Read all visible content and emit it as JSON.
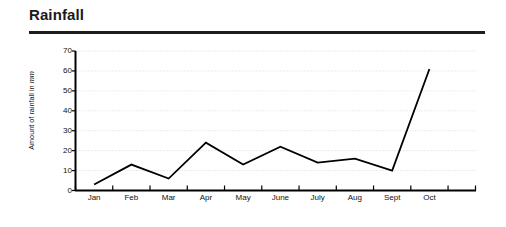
{
  "header": {
    "title": "Rainfall"
  },
  "chart_data": {
    "type": "line",
    "title": "Rainfall",
    "xlabel": "",
    "ylabel": "Amount of rainfall in mm",
    "ylabel_plain": "Amount of rainfall in ",
    "ylabel_italic": "mm",
    "categories": [
      "Jan",
      "Feb",
      "Mar",
      "Apr",
      "May",
      "June",
      "July",
      "Aug",
      "Sept",
      "Oct"
    ],
    "values": [
      3,
      13,
      6,
      24,
      13,
      22,
      14,
      16,
      10,
      61
    ],
    "ylim": [
      0,
      70
    ],
    "ytick_labels": [
      "70",
      "60",
      "50",
      "40",
      "30",
      "20",
      "10",
      "0"
    ],
    "ytick_values": [
      70,
      60,
      50,
      40,
      30,
      20,
      10,
      0
    ],
    "ytick_step": 10,
    "grid": true,
    "grid_style": "dotted-horizontal",
    "legend": "none",
    "line_color": "#000000",
    "grid_color": "#cfcfcf",
    "axis_color": "#000000",
    "background_color": "#ffffff"
  }
}
